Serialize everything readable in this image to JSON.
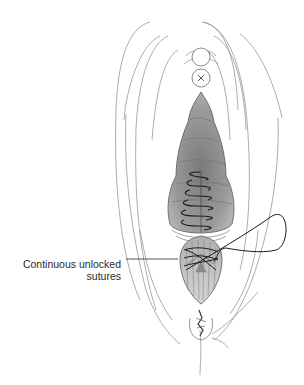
{
  "figure": {
    "annotations": [
      {
        "id": "continuous-unlocked-sutures",
        "lines": [
          "Continuous unlocked",
          "sutures"
        ],
        "leader_from": [
          126,
          259
        ],
        "leader_to": [
          178,
          259
        ]
      }
    ]
  },
  "colors": {
    "background": "#ffffff",
    "outline": "#8a8a8a",
    "dark_outline": "#3a3a3a",
    "tissue_fill": "#8e8e8e",
    "tissue_fill_light": "#a9a9a9",
    "suture": "#1a1a1a",
    "label_text": "#2a2a2a"
  }
}
